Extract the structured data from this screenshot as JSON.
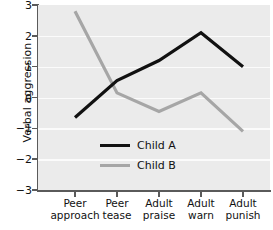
{
  "chart_data": {
    "type": "line",
    "title": "",
    "xlabel": "",
    "ylabel": "Verbal aggression",
    "categories": [
      "Peer approach",
      "Peer tease",
      "Adult praise",
      "Adult warn",
      "Adult punish"
    ],
    "category_lines": [
      [
        "Peer",
        "approach"
      ],
      [
        "Peer",
        "tease"
      ],
      [
        "Adult",
        "praise"
      ],
      [
        "Adult",
        "warn"
      ],
      [
        "Adult",
        "punish"
      ]
    ],
    "ylim": [
      -3,
      3
    ],
    "yticks": [
      3,
      2,
      1,
      0,
      -1,
      -2,
      -3
    ],
    "ytick_labels": [
      "3",
      "2",
      "1",
      "0",
      "−1",
      "−2",
      "−3"
    ],
    "grid": true,
    "grid_axis": "y",
    "legend_position": "inside-lower-left",
    "series": [
      {
        "name": "Child A",
        "color": "#111111",
        "values": [
          -0.65,
          0.55,
          1.2,
          2.1,
          1.0
        ]
      },
      {
        "name": "Child B",
        "color": "#a6a6a6",
        "values": [
          2.8,
          0.15,
          -0.45,
          0.15,
          -1.1
        ]
      }
    ]
  },
  "legend": {
    "items": [
      {
        "label": "Child A",
        "color": "#111111"
      },
      {
        "label": "Child B",
        "color": "#a6a6a6"
      }
    ]
  },
  "style": {
    "plot_background": "#ebebeb",
    "grid_color": "#fbfbfb",
    "axis_color": "#5a5a5a",
    "text_color": "#111111",
    "page_background": "#ffffff"
  }
}
